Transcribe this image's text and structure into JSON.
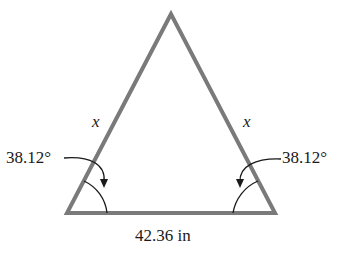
{
  "diagram": {
    "type": "isosceles-triangle",
    "stroke_color": "#7a7a7a",
    "annotation_color": "#1a1a1a",
    "vertices": {
      "apex": [
        171,
        14
      ],
      "bottom_left": [
        67,
        213
      ],
      "bottom_right": [
        275,
        213
      ]
    },
    "labels": {
      "left_side": "x",
      "right_side": "x",
      "left_angle": "38.12°",
      "right_angle": "38.12°",
      "base": "42.36 in"
    }
  }
}
